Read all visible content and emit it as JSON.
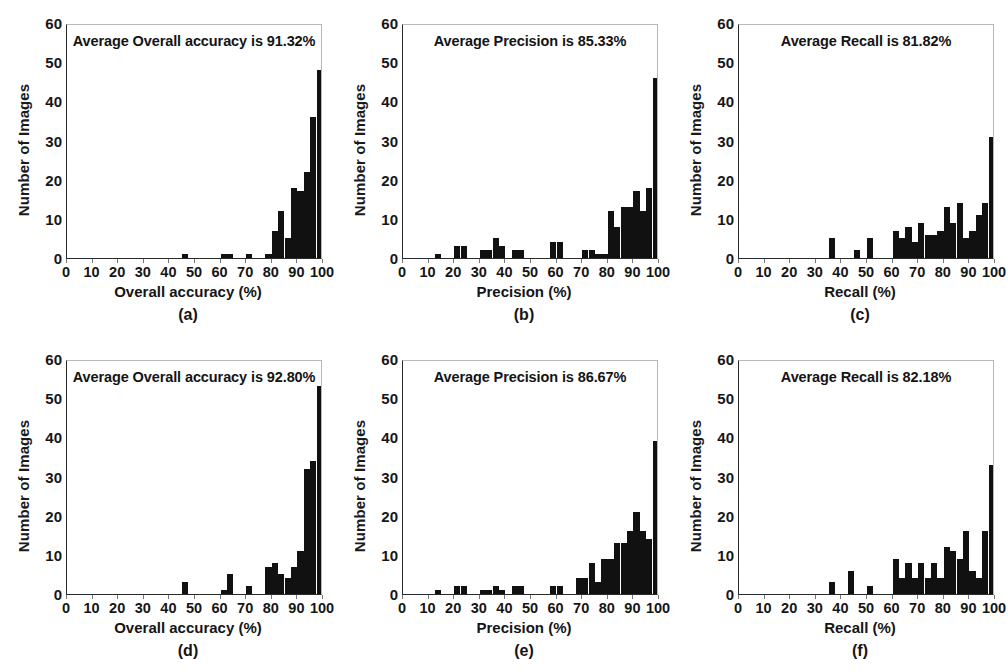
{
  "figure": {
    "panel_count": 6,
    "ylabel": "Number of Images",
    "yticks": [
      "60",
      "50",
      "40",
      "30",
      "20",
      "10",
      "0"
    ],
    "xticks": [
      "0",
      "10",
      "20",
      "30",
      "40",
      "50",
      "60",
      "70",
      "80",
      "90",
      "100"
    ],
    "bar_color": "#111111",
    "background": "#ffffff"
  },
  "chart_data": [
    {
      "type": "bar",
      "id": "a",
      "caption": "(a)",
      "title": "Average Overall accuracy is 91.32%",
      "xlabel": "Overall accuracy (%)",
      "ylabel": "Number of Images",
      "xlim": [
        0,
        100
      ],
      "ylim": [
        0,
        60
      ],
      "grid": false,
      "bin_width": 2.5,
      "bin_starts": [
        0,
        2.5,
        5,
        7.5,
        10,
        12.5,
        15,
        17.5,
        20,
        22.5,
        25,
        27.5,
        30,
        32.5,
        35,
        37.5,
        40,
        42.5,
        45,
        47.5,
        50,
        52.5,
        55,
        57.5,
        60,
        62.5,
        65,
        67.5,
        70,
        72.5,
        75,
        77.5,
        80,
        82.5,
        85,
        87.5,
        90,
        92.5,
        95,
        97.5
      ],
      "values": [
        0,
        0,
        0,
        0,
        0,
        0,
        0,
        0,
        0,
        0,
        0,
        0,
        0,
        0,
        0,
        0,
        0,
        0,
        1,
        0,
        0,
        0,
        0,
        0,
        1,
        1,
        0,
        0,
        1,
        0,
        0,
        1,
        7,
        12,
        5,
        18,
        17,
        22,
        36,
        48
      ],
      "notable": {
        "peak_value": 48,
        "peak_bin": "97.5-100"
      }
    },
    {
      "type": "bar",
      "id": "b",
      "caption": "(b)",
      "title": "Average Precision is 85.33%",
      "xlabel": "Precision (%)",
      "ylabel": "Number of Images",
      "xlim": [
        0,
        100
      ],
      "ylim": [
        0,
        60
      ],
      "grid": false,
      "bin_width": 2.5,
      "bin_starts": [
        0,
        2.5,
        5,
        7.5,
        10,
        12.5,
        15,
        17.5,
        20,
        22.5,
        25,
        27.5,
        30,
        32.5,
        35,
        37.5,
        40,
        42.5,
        45,
        47.5,
        50,
        52.5,
        55,
        57.5,
        60,
        62.5,
        65,
        67.5,
        70,
        72.5,
        75,
        77.5,
        80,
        82.5,
        85,
        87.5,
        90,
        92.5,
        95,
        97.5
      ],
      "values": [
        0,
        0,
        0,
        0,
        0,
        1,
        0,
        0,
        3,
        3,
        0,
        0,
        2,
        2,
        5,
        3,
        0,
        2,
        2,
        0,
        0,
        0,
        0,
        4,
        4,
        0,
        0,
        0,
        2,
        2,
        1,
        1,
        12,
        8,
        13,
        13,
        17,
        12,
        18,
        46
      ],
      "notable": {
        "peak_value": 46,
        "peak_bin": "97.5-100"
      }
    },
    {
      "type": "bar",
      "id": "c",
      "caption": "(c)",
      "title": "Average Recall is 81.82%",
      "xlabel": "Recall (%)",
      "ylabel": "Number of Images",
      "xlim": [
        0,
        100
      ],
      "ylim": [
        0,
        60
      ],
      "grid": false,
      "bin_width": 2.5,
      "bin_starts": [
        0,
        2.5,
        5,
        7.5,
        10,
        12.5,
        15,
        17.5,
        20,
        22.5,
        25,
        27.5,
        30,
        32.5,
        35,
        37.5,
        40,
        42.5,
        45,
        47.5,
        50,
        52.5,
        55,
        57.5,
        60,
        62.5,
        65,
        67.5,
        70,
        72.5,
        75,
        77.5,
        80,
        82.5,
        85,
        87.5,
        90,
        92.5,
        95,
        97.5
      ],
      "values": [
        0,
        0,
        0,
        0,
        0,
        0,
        0,
        0,
        0,
        0,
        0,
        0,
        0,
        0,
        5,
        0,
        0,
        0,
        2,
        0,
        5,
        0,
        0,
        0,
        7,
        5,
        8,
        4,
        9,
        6,
        6,
        7,
        13,
        9,
        14,
        5,
        7,
        11,
        14,
        31
      ],
      "notable": {
        "peak_value": 31,
        "peak_bin": "97.5-100"
      }
    },
    {
      "type": "bar",
      "id": "d",
      "caption": "(d)",
      "title": "Average Overall accuracy is 92.80%",
      "xlabel": "Overall accuracy (%)",
      "ylabel": "Number of Images",
      "xlim": [
        0,
        100
      ],
      "ylim": [
        0,
        60
      ],
      "grid": false,
      "bin_width": 2.5,
      "bin_starts": [
        0,
        2.5,
        5,
        7.5,
        10,
        12.5,
        15,
        17.5,
        20,
        22.5,
        25,
        27.5,
        30,
        32.5,
        35,
        37.5,
        40,
        42.5,
        45,
        47.5,
        50,
        52.5,
        55,
        57.5,
        60,
        62.5,
        65,
        67.5,
        70,
        72.5,
        75,
        77.5,
        80,
        82.5,
        85,
        87.5,
        90,
        92.5,
        95,
        97.5
      ],
      "values": [
        0,
        0,
        0,
        0,
        0,
        0,
        0,
        0,
        0,
        0,
        0,
        0,
        0,
        0,
        0,
        0,
        0,
        0,
        3,
        0,
        0,
        0,
        0,
        0,
        1,
        5,
        0,
        0,
        2,
        0,
        0,
        7,
        8,
        5,
        4,
        7,
        11,
        32,
        34,
        53
      ],
      "notable": {
        "peak_value": 53,
        "peak_bin": "97.5-100"
      }
    },
    {
      "type": "bar",
      "id": "e",
      "caption": "(e)",
      "title": "Average Precision is 86.67%",
      "xlabel": "Precision (%)",
      "ylabel": "Number of Images",
      "xlim": [
        0,
        100
      ],
      "ylim": [
        0,
        60
      ],
      "grid": false,
      "bin_width": 2.5,
      "bin_starts": [
        0,
        2.5,
        5,
        7.5,
        10,
        12.5,
        15,
        17.5,
        20,
        22.5,
        25,
        27.5,
        30,
        32.5,
        35,
        37.5,
        40,
        42.5,
        45,
        47.5,
        50,
        52.5,
        55,
        57.5,
        60,
        62.5,
        65,
        67.5,
        70,
        72.5,
        75,
        77.5,
        80,
        82.5,
        85,
        87.5,
        90,
        92.5,
        95,
        97.5
      ],
      "values": [
        0,
        0,
        0,
        0,
        0,
        1,
        0,
        0,
        2,
        2,
        0,
        0,
        1,
        1,
        2,
        1,
        0,
        2,
        2,
        0,
        0,
        0,
        0,
        2,
        2,
        0,
        0,
        4,
        4,
        8,
        3,
        9,
        9,
        13,
        13,
        16,
        21,
        16,
        14,
        39
      ],
      "notable": {
        "peak_value": 39,
        "peak_bin": "97.5-100"
      }
    },
    {
      "type": "bar",
      "id": "f",
      "caption": "(f)",
      "title": "Average Recall is 82.18%",
      "xlabel": "Recall (%)",
      "ylabel": "Number of Images",
      "xlim": [
        0,
        100
      ],
      "ylim": [
        0,
        60
      ],
      "grid": false,
      "bin_width": 2.5,
      "bin_starts": [
        0,
        2.5,
        5,
        7.5,
        10,
        12.5,
        15,
        17.5,
        20,
        22.5,
        25,
        27.5,
        30,
        32.5,
        35,
        37.5,
        40,
        42.5,
        45,
        47.5,
        50,
        52.5,
        55,
        57.5,
        60,
        62.5,
        65,
        67.5,
        70,
        72.5,
        75,
        77.5,
        80,
        82.5,
        85,
        87.5,
        90,
        92.5,
        95,
        97.5
      ],
      "values": [
        0,
        0,
        0,
        0,
        0,
        0,
        0,
        0,
        0,
        0,
        0,
        0,
        0,
        0,
        3,
        0,
        0,
        6,
        0,
        0,
        2,
        0,
        0,
        0,
        9,
        4,
        8,
        4,
        8,
        4,
        8,
        4,
        12,
        11,
        9,
        16,
        6,
        4,
        16,
        33
      ],
      "notable": {
        "peak_value": 33,
        "peak_bin": "97.5-100"
      }
    }
  ]
}
